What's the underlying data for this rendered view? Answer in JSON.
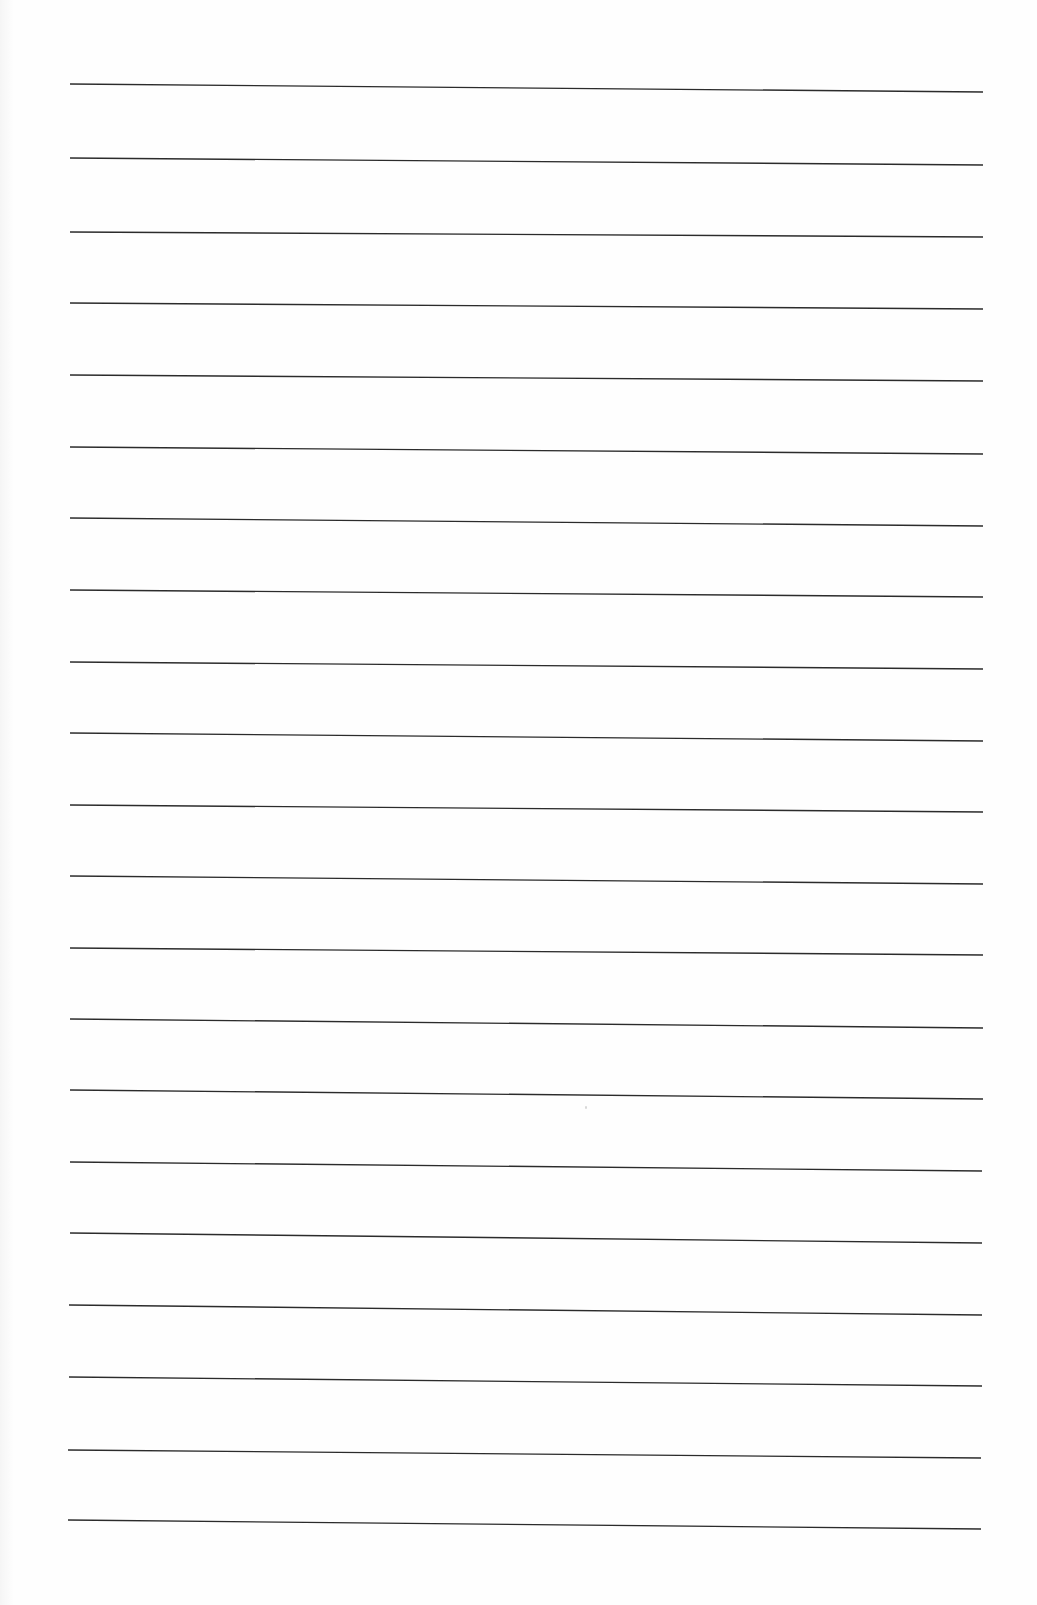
{
  "document": {
    "type": "blank ruled sheet",
    "background_color": "#fefefe",
    "line_color": "#2b2b2b",
    "line_count": 21,
    "written_text": []
  },
  "ruled_lines": [
    {
      "x1": 70,
      "y1": 84,
      "x2": 983,
      "y2": 92
    },
    {
      "x1": 70,
      "y1": 158,
      "x2": 983,
      "y2": 165
    },
    {
      "x1": 70,
      "y1": 232,
      "x2": 983,
      "y2": 237
    },
    {
      "x1": 70,
      "y1": 303,
      "x2": 983,
      "y2": 309
    },
    {
      "x1": 70,
      "y1": 375,
      "x2": 983,
      "y2": 381
    },
    {
      "x1": 70,
      "y1": 447,
      "x2": 983,
      "y2": 454
    },
    {
      "x1": 70,
      "y1": 518,
      "x2": 983,
      "y2": 526
    },
    {
      "x1": 70,
      "y1": 590,
      "x2": 983,
      "y2": 597
    },
    {
      "x1": 70,
      "y1": 662,
      "x2": 983,
      "y2": 669
    },
    {
      "x1": 70,
      "y1": 733,
      "x2": 983,
      "y2": 741
    },
    {
      "x1": 70,
      "y1": 805,
      "x2": 983,
      "y2": 812
    },
    {
      "x1": 70,
      "y1": 876,
      "x2": 983,
      "y2": 884
    },
    {
      "x1": 70,
      "y1": 948,
      "x2": 983,
      "y2": 955
    },
    {
      "x1": 70,
      "y1": 1019,
      "x2": 983,
      "y2": 1028
    },
    {
      "x1": 70,
      "y1": 1090,
      "x2": 983,
      "y2": 1099
    },
    {
      "x1": 70,
      "y1": 1162,
      "x2": 982,
      "y2": 1171
    },
    {
      "x1": 70,
      "y1": 1233,
      "x2": 982,
      "y2": 1243
    },
    {
      "x1": 69,
      "y1": 1305,
      "x2": 982,
      "y2": 1315
    },
    {
      "x1": 69,
      "y1": 1377,
      "x2": 982,
      "y2": 1386
    },
    {
      "x1": 68,
      "y1": 1450,
      "x2": 981,
      "y2": 1458
    },
    {
      "x1": 68,
      "y1": 1520,
      "x2": 981,
      "y2": 1529
    }
  ],
  "specks": [
    {
      "x": 585,
      "y": 1106
    }
  ]
}
